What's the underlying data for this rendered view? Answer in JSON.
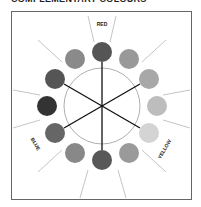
{
  "title": "COMPLEMENTARY COLOURS",
  "labels": {
    "red": "RED",
    "yellow": "YELLOW",
    "blue": "BLUE"
  },
  "wheel": {
    "center": [
      102,
      106
    ],
    "inner_radius": 38,
    "swatch_ring_radius": 54,
    "swatch_radius": 10,
    "swatches": [
      {
        "angle": 0,
        "tone": "#555555"
      },
      {
        "angle": 30,
        "tone": "#999999"
      },
      {
        "angle": 60,
        "tone": "#a8a8a8"
      },
      {
        "angle": 90,
        "tone": "#bdbdbd"
      },
      {
        "angle": 120,
        "tone": "#d4d4d4"
      },
      {
        "angle": 150,
        "tone": "#9a9a9a"
      },
      {
        "angle": 180,
        "tone": "#585858"
      },
      {
        "angle": 210,
        "tone": "#888888"
      },
      {
        "angle": 240,
        "tone": "#666666"
      },
      {
        "angle": 270,
        "tone": "#333333"
      },
      {
        "angle": 300,
        "tone": "#555555"
      },
      {
        "angle": 330,
        "tone": "#8a8a8a"
      }
    ],
    "spokes_deg": [
      0,
      60,
      120,
      180,
      240,
      300
    ]
  }
}
